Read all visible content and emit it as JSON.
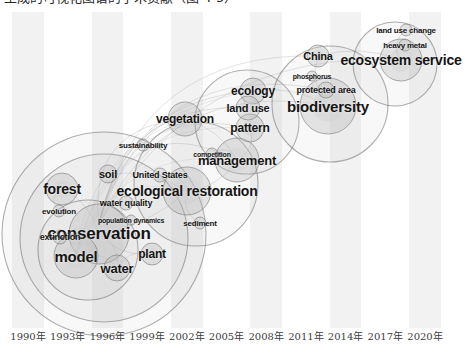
{
  "caption": {
    "text": "生成的可视化图谱的学术贡献（图 4-5）"
  },
  "chart_data": {
    "type": "scatter",
    "title": "",
    "xlabel": "",
    "ylabel": "",
    "grid": false,
    "legend_position": "none",
    "xlim": [
      1989,
      2021
    ],
    "xticks": [
      "1990年",
      "1993年",
      "1996年",
      "1999年",
      "2002年",
      "2005年",
      "2008年",
      "2011年",
      "2014年",
      "2017年",
      "2020年"
    ],
    "xtick_values": [
      1990,
      1993,
      1996,
      1999,
      2002,
      2005,
      2008,
      2011,
      2014,
      2017,
      2020
    ],
    "accent_colors": {
      "band": "#f2f2f2",
      "node_fill": "#b8b8b8",
      "node_stroke": "#6e6e6e",
      "link": "#8c8c8c",
      "label": "#141414",
      "tick": "#3d3d3d"
    },
    "nodes": [
      {
        "label": "conservation",
        "x": 99,
        "y": 222,
        "size": 17,
        "r": 30
      },
      {
        "label": "model",
        "x": 76,
        "y": 244,
        "size": 15,
        "r": 22
      },
      {
        "label": "forest",
        "x": 62,
        "y": 177,
        "size": 14,
        "r": 16
      },
      {
        "label": "water",
        "x": 117,
        "y": 256,
        "size": 13,
        "r": 13
      },
      {
        "label": "plant",
        "x": 152,
        "y": 242,
        "size": 12,
        "r": 11
      },
      {
        "label": "extinction",
        "x": 60,
        "y": 225,
        "size": 9,
        "r": 7
      },
      {
        "label": "evolution",
        "x": 59,
        "y": 199,
        "size": 8,
        "r": 6
      },
      {
        "label": "population dynamics",
        "x": 131,
        "y": 208,
        "size": 7,
        "r": 5
      },
      {
        "label": "water quality",
        "x": 126,
        "y": 191,
        "size": 9,
        "r": 7
      },
      {
        "label": "soil",
        "x": 108,
        "y": 162,
        "size": 11,
        "r": 9
      },
      {
        "label": "United States",
        "x": 160,
        "y": 163,
        "size": 9,
        "r": 7
      },
      {
        "label": "ecological restoration",
        "x": 187,
        "y": 179,
        "size": 14,
        "r": 24
      },
      {
        "label": "sediment",
        "x": 200,
        "y": 211,
        "size": 8,
        "r": 6
      },
      {
        "label": "sustainability",
        "x": 143,
        "y": 133,
        "size": 8,
        "r": 6
      },
      {
        "label": "competition",
        "x": 212,
        "y": 142,
        "size": 7,
        "r": 6
      },
      {
        "label": "management",
        "x": 237,
        "y": 148,
        "size": 13,
        "r": 22
      },
      {
        "label": "vegetation",
        "x": 185,
        "y": 107,
        "size": 12,
        "r": 17
      },
      {
        "label": "pattern",
        "x": 250,
        "y": 116,
        "size": 12,
        "r": 14
      },
      {
        "label": "land use",
        "x": 248,
        "y": 96,
        "size": 11,
        "r": 12
      },
      {
        "label": "ecology",
        "x": 253,
        "y": 79,
        "size": 12,
        "r": 13
      },
      {
        "label": "biodiversity",
        "x": 328,
        "y": 94,
        "size": 15,
        "r": 28
      },
      {
        "label": "protected area",
        "x": 326,
        "y": 78,
        "size": 9,
        "r": 8
      },
      {
        "label": "phosphorus",
        "x": 312,
        "y": 64,
        "size": 7,
        "r": 5
      },
      {
        "label": "China",
        "x": 318,
        "y": 44,
        "size": 11,
        "r": 11
      },
      {
        "label": "ecosystem service",
        "x": 401,
        "y": 48,
        "size": 14,
        "r": 21
      },
      {
        "label": "heavy metal",
        "x": 405,
        "y": 33,
        "size": 8,
        "r": 6
      },
      {
        "label": "land use change",
        "x": 406,
        "y": 18,
        "size": 8,
        "r": 6
      }
    ]
  }
}
